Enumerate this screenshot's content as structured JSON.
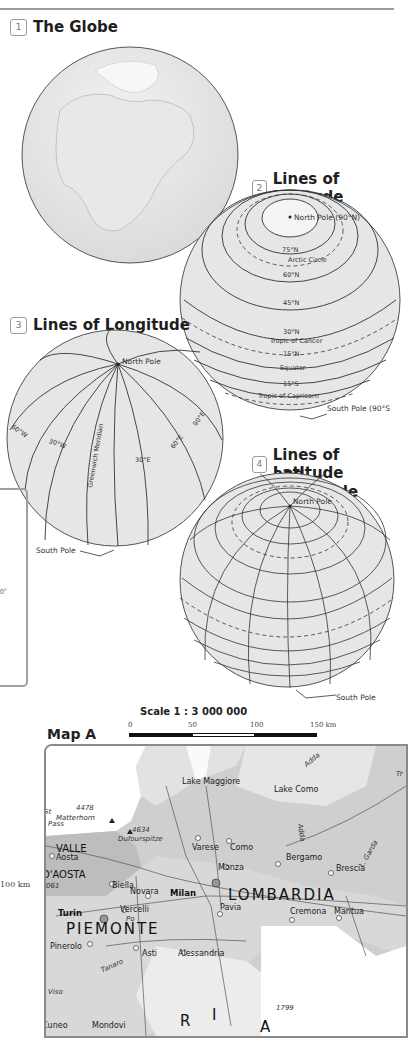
{
  "sections": [
    {
      "number": "1",
      "title": "The Globe"
    },
    {
      "number": "2",
      "title": "Lines of Latitude",
      "labels": [
        "North Pole (90°N)",
        "75°N",
        "Arctic Circle",
        "60°N",
        "45°N",
        "30°N",
        "Tropic of Cancer",
        "15°N",
        "Equator",
        "15°S",
        "Tropic of Capricorn",
        "South Pole (90°S"
      ]
    },
    {
      "number": "3",
      "title": "Lines of Longitude",
      "labels": [
        "North Pole",
        "60°W",
        "30°W",
        "Greenwich Meridian",
        "30°E",
        "60°E",
        "90°E",
        "South Pole"
      ]
    },
    {
      "number": "4",
      "title_line1": "Lines of Latitude",
      "title_line2": "and Longitude",
      "labels": [
        "North Pole",
        "South Pole"
      ]
    }
  ],
  "side_fragments": {
    "degree_text": "0°",
    "km_text": "100 km"
  },
  "map_a": {
    "title": "Map A",
    "scale_title": "Scale 1 : 3 000 000",
    "scale_ticks": [
      "0",
      "50",
      "100",
      "150 km"
    ],
    "regions": [
      "VALLE",
      "D'AOSTA",
      "LOMBARDIA",
      "PIEMONTE",
      "R",
      "I",
      "A"
    ],
    "peaks": [
      {
        "elevation": "4478",
        "name": "Matterhorn"
      },
      {
        "elevation": "4634",
        "name": "Dufourspitze"
      },
      {
        "elevation": "061",
        "name": "Gran Paradiso"
      },
      {
        "elevation": "1799",
        "name": ""
      }
    ],
    "cities_bold": [
      "Milan",
      "Turin"
    ],
    "cities": [
      "Aosta",
      "Biella",
      "Varese",
      "Como",
      "Monza",
      "Bergamo",
      "Brescia",
      "Novara",
      "Vercelli",
      "Pavia",
      "Cremona",
      "Mantua",
      "Pinerolo",
      "Asti",
      "Alessandria",
      "Mondovi",
      "Cuneo"
    ],
    "water": [
      "Lake Maggiore",
      "Lake Como",
      "Adda",
      "Adda",
      "Po",
      "Tanaro",
      "L. Garda",
      "Adda"
    ],
    "other_text": [
      "St",
      "Pass",
      "Viso",
      "Tr"
    ]
  }
}
